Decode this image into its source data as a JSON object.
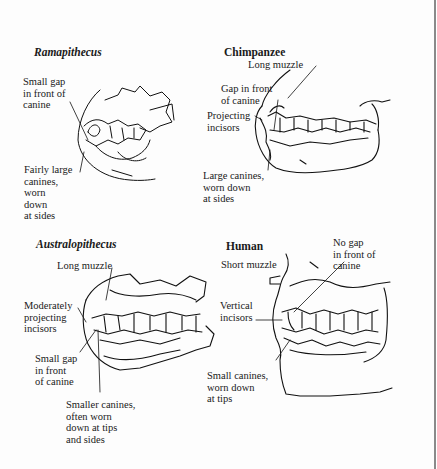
{
  "figure": {
    "panels": [
      {
        "id": "ramapithecus",
        "title": "Ramapithecus",
        "title_style": "italic-bold",
        "labels": [
          "Small gap\nin front of\ncanine",
          "Fairly large\ncanines,\nworn\ndown\nat sides"
        ]
      },
      {
        "id": "chimpanzee",
        "title": "Chimpanzee",
        "title_style": "bold",
        "labels": [
          "Long muzzle",
          "Gap in front\nof canine",
          "Projecting\nincisors",
          "Large canines,\nworn down\nat sides"
        ]
      },
      {
        "id": "australopithecus",
        "title": "Australopithecus",
        "title_style": "italic-bold",
        "labels": [
          "Long muzzle",
          "Moderately\nprojecting\nincisors",
          "Small gap\nin front\nof canine",
          "Smaller canines,\noften worn\ndown at tips\nand sides"
        ]
      },
      {
        "id": "human",
        "title": "Human",
        "title_style": "bold",
        "labels": [
          "Short muzzle",
          "No gap\nin front of\ncanine",
          "Vertical\nincisors",
          "Small canines,\nworn down\nat tips"
        ]
      }
    ]
  },
  "colors": {
    "ink": "#111111",
    "paper": "#fdfdfd",
    "edge": "#8a8a8a"
  }
}
